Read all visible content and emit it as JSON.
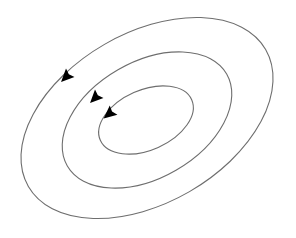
{
  "diagram": {
    "type": "concentric tilted elliptical loops with direction arrows",
    "background_color": "#ffffff",
    "stroke_color": "#6e6e6e",
    "arrow_color": "#000000",
    "direction": "counterclockwise",
    "loops": [
      {
        "name": "outer",
        "cx": 147,
        "cy": 118,
        "rx": 137,
        "ry": 85,
        "rotation": -30
      },
      {
        "name": "middle",
        "cx": 147,
        "cy": 120,
        "rx": 92,
        "ry": 58,
        "rotation": -30
      },
      {
        "name": "inner",
        "cx": 146,
        "cy": 120,
        "rx": 50,
        "ry": 30,
        "rotation": -24
      }
    ],
    "arrows": [
      {
        "loop": "outer",
        "x": 66,
        "y": 77,
        "angle": 135
      },
      {
        "loop": "middle",
        "x": 95,
        "y": 98,
        "angle": 135
      },
      {
        "loop": "inner",
        "x": 109,
        "y": 114,
        "angle": 140
      }
    ]
  }
}
